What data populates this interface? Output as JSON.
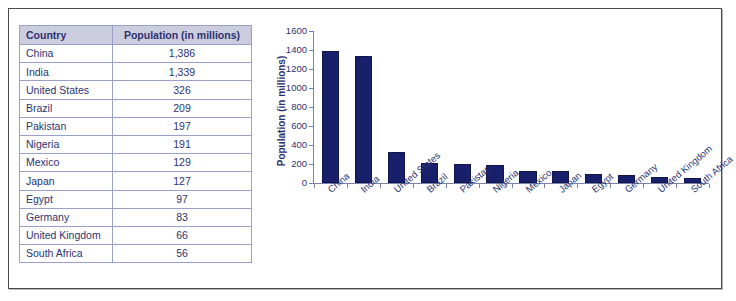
{
  "table": {
    "headers": [
      "Country",
      "Population (in millions)"
    ],
    "rows": [
      {
        "country": "China",
        "population": "1,386"
      },
      {
        "country": "India",
        "population": "1,339"
      },
      {
        "country": "United States",
        "population": "326"
      },
      {
        "country": "Brazil",
        "population": "209"
      },
      {
        "country": "Pakistan",
        "population": "197"
      },
      {
        "country": "Nigeria",
        "population": "191"
      },
      {
        "country": "Mexico",
        "population": "129"
      },
      {
        "country": "Japan",
        "population": "127"
      },
      {
        "country": "Egypt",
        "population": "97"
      },
      {
        "country": "Germany",
        "population": "83"
      },
      {
        "country": "United Kingdom",
        "population": "66"
      },
      {
        "country": "South Africa",
        "population": "56"
      }
    ]
  },
  "colors": {
    "bar_fill": "#19206b",
    "bar_stroke": "#10154a",
    "axis": "#7b80ad",
    "text": "#2c3270",
    "table_header_bg": "#ccccdf",
    "table_border": "#9aa0c8",
    "frame_border": "#4a4a4a"
  },
  "chart_data": {
    "type": "bar",
    "title": "",
    "xlabel": "",
    "ylabel": "Population (in millions)",
    "categories": [
      "China",
      "India",
      "United States",
      "Brazil",
      "Pakistan",
      "Nigeria",
      "Mexico",
      "Japan",
      "Egypt",
      "Germany",
      "United Kingdom",
      "South Africa"
    ],
    "values": [
      1386,
      1339,
      326,
      209,
      197,
      191,
      129,
      127,
      97,
      83,
      66,
      56
    ],
    "ylim": [
      0,
      1600
    ],
    "ytick_step": 200,
    "yticks": [
      0,
      200,
      400,
      600,
      800,
      1000,
      1200,
      1400,
      1600
    ],
    "ytick_labels": [
      "0",
      "200",
      "400",
      "600",
      "800",
      "1000",
      "1200",
      "1400",
      "1600"
    ],
    "grid": false,
    "legend": false
  }
}
